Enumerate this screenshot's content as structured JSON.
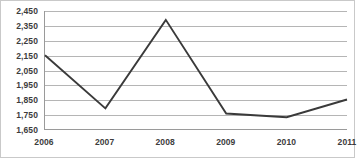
{
  "chart_data": {
    "type": "line",
    "title": "",
    "xlabel": "",
    "ylabel": "",
    "categories": [
      "2006",
      "2007",
      "2008",
      "2009",
      "2010",
      "2011"
    ],
    "values": [
      2150,
      1790,
      2390,
      1755,
      1730,
      1850
    ],
    "series": [
      {
        "name": "",
        "values": [
          2150,
          1790,
          2390,
          1755,
          1730,
          1850
        ],
        "color": "#3a3a3a"
      }
    ],
    "ylim": [
      1650,
      2450
    ],
    "y_ticks": [
      1650,
      1750,
      1850,
      1950,
      2050,
      2150,
      2250,
      2350,
      2450
    ],
    "y_tick_labels": [
      "1,650",
      "1,750",
      "1,850",
      "1,950",
      "2,050",
      "2,150",
      "2,250",
      "2,350",
      "2,450"
    ],
    "grid": true,
    "legend": "none",
    "markers": false
  },
  "style": {
    "line_color": "#3a3a3a",
    "grid_color": "#b5b5b5",
    "axis_color": "#9a9a9a",
    "text_color": "#3c3c3c",
    "background": "#ffffff",
    "border_color": "#c9c9c9"
  }
}
